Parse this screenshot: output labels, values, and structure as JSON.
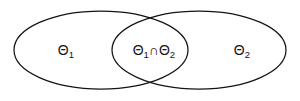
{
  "figure": {
    "type": "venn-diagram",
    "background_color": "#ffffff",
    "stroke_color": "#141414",
    "stroke_width": 1.25,
    "width": 300,
    "height": 101
  },
  "sets": {
    "left": {
      "name": "Theta 1",
      "label_base": "Θ",
      "label_sub": "1",
      "label_text": "Θ1",
      "center_x": 101,
      "center_y": 50,
      "radius_x": 87,
      "radius_y": 39,
      "label_x": 62,
      "label_y": 50
    },
    "right": {
      "name": "Theta 2",
      "label_base": "Θ",
      "label_sub": "2",
      "label_text": "Θ2",
      "center_x": 199,
      "center_y": 50,
      "radius_x": 87,
      "radius_y": 39,
      "label_x": 238,
      "label_y": 50
    },
    "intersection": {
      "name": "Theta 1 intersect Theta 2",
      "label_base_1": "Θ",
      "label_sub_1": "1",
      "operator": "∩",
      "label_base_2": "Θ",
      "label_sub_2": "2",
      "label_text": "Θ1 ∩ Θ2",
      "label_x": 150,
      "label_y": 50
    }
  },
  "crossings": {
    "top": {
      "x": 150,
      "y": 17
    },
    "bottom": {
      "x": 150,
      "y": 84
    }
  }
}
